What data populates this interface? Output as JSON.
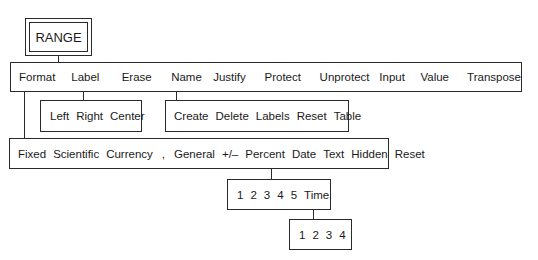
{
  "root": {
    "label": "RANGE"
  },
  "menubar": {
    "items": [
      "Format",
      "Label",
      "Erase",
      "Name",
      "Justify",
      "Protect",
      "Unprotect",
      "Input",
      "Value",
      "Transpose"
    ]
  },
  "label_submenu": {
    "items": [
      "Left",
      "Right",
      "Center"
    ]
  },
  "name_submenu": {
    "items": [
      "Create",
      "Delete",
      "Labels",
      "Reset",
      "Table"
    ]
  },
  "format_submenu": {
    "items": [
      "Fixed",
      "Scientific",
      "Currency",
      ",",
      "General",
      "+/–",
      "Percent",
      "Date",
      "Text",
      "Hidden",
      "Reset"
    ]
  },
  "date_submenu": {
    "items": [
      "1",
      "2",
      "3",
      "4",
      "5",
      "Time"
    ]
  },
  "time_submenu": {
    "items": [
      "1",
      "2",
      "3",
      "4"
    ]
  }
}
